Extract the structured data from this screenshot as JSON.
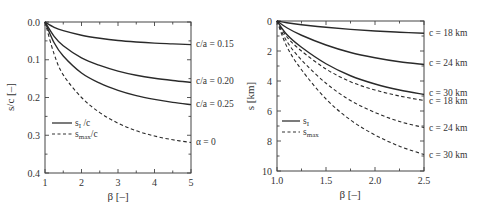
{
  "chart_data": [
    {
      "type": "line",
      "panel": "left",
      "title": "",
      "xlabel": "β [–]",
      "ylabel": "s/c [–]",
      "xlim": [
        1,
        5
      ],
      "ylim": [
        0.4,
        0.0
      ],
      "y_inverted": true,
      "xticks": [
        "1",
        "2",
        "3",
        "4",
        "5"
      ],
      "yticks": [
        "0.0",
        "0.1",
        "0.2",
        "0.3",
        "0.4"
      ],
      "grid": false,
      "legend": {
        "position": "lower-left",
        "entries": [
          {
            "label": "s",
            "sub": "I",
            "suffix": "/c",
            "style": "solid"
          },
          {
            "label": "s",
            "sub": "max",
            "suffix": "/c",
            "style": "dashed"
          }
        ]
      },
      "x": [
        1.0,
        1.25,
        1.5,
        2.0,
        2.5,
        3.0,
        3.5,
        4.0,
        4.5,
        5.0
      ],
      "series": [
        {
          "name": "c/a=0.15",
          "style": "solid",
          "values": [
            0.0,
            0.014,
            0.023,
            0.035,
            0.043,
            0.049,
            0.053,
            0.056,
            0.058,
            0.06
          ]
        },
        {
          "name": "c/a=0.20",
          "style": "solid",
          "values": [
            0.0,
            0.038,
            0.063,
            0.095,
            0.115,
            0.13,
            0.141,
            0.149,
            0.155,
            0.16
          ]
        },
        {
          "name": "c/a=0.25",
          "style": "solid",
          "values": [
            0.0,
            0.055,
            0.09,
            0.135,
            0.162,
            0.181,
            0.195,
            0.205,
            0.213,
            0.219
          ]
        },
        {
          "name": "α=0",
          "style": "dashed",
          "values": [
            0.0,
            0.085,
            0.14,
            0.2,
            0.24,
            0.268,
            0.288,
            0.302,
            0.312,
            0.319
          ]
        }
      ],
      "annotations": [
        "c/a=0.15",
        "c/a=0.20",
        "c/a=0.25",
        "α=0"
      ]
    },
    {
      "type": "line",
      "panel": "right",
      "title": "",
      "xlabel": "β [–]",
      "ylabel": "s [km]",
      "xlim": [
        1.0,
        2.5
      ],
      "ylim": [
        10,
        0
      ],
      "y_inverted": true,
      "xticks": [
        "1.0",
        "1.5",
        "2.0",
        "2.5"
      ],
      "yticks": [
        "0",
        "2",
        "4",
        "6",
        "8",
        "10"
      ],
      "grid": false,
      "legend": {
        "position": "lower-left",
        "entries": [
          {
            "label": "s",
            "sub": "I",
            "suffix": "",
            "style": "solid"
          },
          {
            "label": "s",
            "sub": "max",
            "suffix": "",
            "style": "dashed"
          }
        ]
      },
      "x": [
        1.0,
        1.1,
        1.25,
        1.5,
        1.75,
        2.0,
        2.25,
        2.5
      ],
      "series": [
        {
          "name": "s_I c=18 km",
          "style": "solid",
          "values": [
            0.0,
            0.12,
            0.25,
            0.42,
            0.56,
            0.67,
            0.75,
            0.82
          ]
        },
        {
          "name": "s_I c=24 km",
          "style": "solid",
          "values": [
            0.0,
            0.45,
            0.95,
            1.6,
            2.1,
            2.45,
            2.72,
            2.9
          ]
        },
        {
          "name": "s_I c=30 km",
          "style": "solid",
          "values": [
            0.0,
            0.9,
            1.75,
            2.85,
            3.65,
            4.2,
            4.6,
            4.9
          ]
        },
        {
          "name": "s_max c=18 km",
          "style": "dashed",
          "values": [
            0.0,
            1.05,
            2.0,
            3.2,
            4.05,
            4.6,
            5.0,
            5.3
          ]
        },
        {
          "name": "s_max c=24 km",
          "style": "dashed",
          "values": [
            0.0,
            1.35,
            2.6,
            4.15,
            5.3,
            6.1,
            6.7,
            7.1
          ]
        },
        {
          "name": "s_max c=30 km",
          "style": "dashed",
          "values": [
            0.0,
            1.7,
            3.25,
            5.2,
            6.6,
            7.6,
            8.35,
            8.9
          ]
        }
      ],
      "annotations": [
        "c=18 km",
        "c=24 km",
        "c=30 km",
        "c=18 km",
        "c=24 km",
        "c=30 km"
      ]
    }
  ],
  "left": {
    "ylabel": "s/c [–]",
    "xlabel": "β [–]",
    "xticks": [
      "1",
      "2",
      "3",
      "4",
      "5"
    ],
    "yticks": [
      "0.0",
      "0.1",
      "0.2",
      "0.3",
      "0.4"
    ],
    "labels": [
      "c/a = 0.15",
      "c/a = 0.20",
      "c/a = 0.25",
      "α = 0"
    ],
    "legend": [
      {
        "main": "s",
        "sub": "I",
        "suffix": " /c"
      },
      {
        "main": "s",
        "sub": "max",
        "suffix": "/c"
      }
    ]
  },
  "right": {
    "ylabel": "s [km]",
    "xlabel": "β [–]",
    "xticks": [
      "1.0",
      "1.5",
      "2.0",
      "2.5"
    ],
    "yticks": [
      "0",
      "2",
      "4",
      "6",
      "8",
      "10"
    ],
    "labels": [
      "c = 18 km",
      "c = 24 km",
      "c = 30 km",
      "c = 18 km",
      "c = 24 km",
      "c = 30 km"
    ],
    "legend": [
      {
        "main": "s",
        "sub": "I",
        "suffix": ""
      },
      {
        "main": "s",
        "sub": "max",
        "suffix": ""
      }
    ]
  }
}
